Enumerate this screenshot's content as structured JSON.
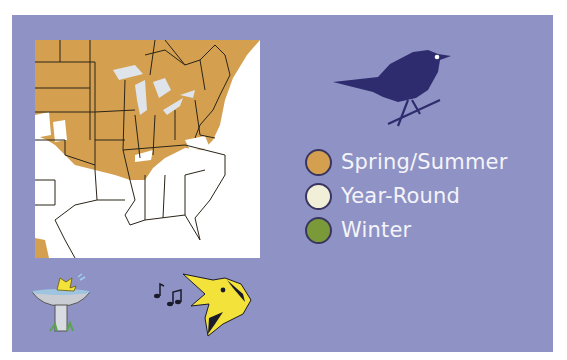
{
  "panel": {
    "background": "#8f92c4"
  },
  "map": {
    "region": "Eastern United States",
    "colors": {
      "range": "#d4a04f",
      "land": "#ffffff",
      "water": "#dfe3ea",
      "borders": "#2a2418"
    }
  },
  "legend": {
    "items": [
      {
        "label": "Spring/Summer",
        "color": "#d4a04f"
      },
      {
        "label": "Year-Round",
        "color": "#f2efd8"
      },
      {
        "label": "Winter",
        "color": "#7a9a3a"
      }
    ]
  },
  "illustrations": {
    "silhouette": {
      "color": "#2e2c6e"
    },
    "bird_bath": {
      "bird_color": "#f2e23a"
    },
    "singing_head": {
      "color": "#f2e23a"
    }
  }
}
